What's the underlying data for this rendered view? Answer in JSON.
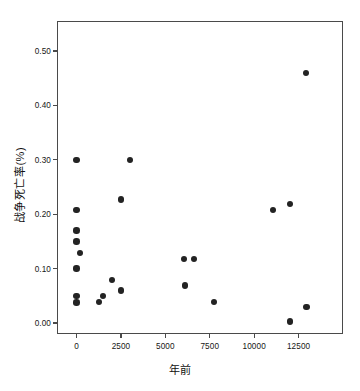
{
  "chart": {
    "title": "",
    "y_axis_label": "战争死亡率(%)",
    "x_axis_label": "年前"
  },
  "chart_data": {
    "type": "scatter",
    "title": "",
    "xlabel": "年前",
    "ylabel": "战争死亡率(%)",
    "xlim": [
      -1100,
      15000
    ],
    "ylim": [
      -0.02,
      0.555
    ],
    "grid": false,
    "legend": null,
    "xticks": [
      0,
      2500,
      5000,
      7500,
      10000,
      12500
    ],
    "xticklabels": [
      "0",
      "2500",
      "5000",
      "7500",
      "10000",
      "12500"
    ],
    "yticks": [
      0.0,
      0.1,
      0.2,
      0.3,
      0.4,
      0.5
    ],
    "yticklabels": [
      "0.00",
      "0.10",
      "0.20",
      "0.30",
      "0.40",
      "0.50"
    ],
    "marker": "circle",
    "marker_color": "#232323",
    "marker_size": 6.4,
    "points": [
      {
        "x": 0,
        "y": 0.3
      },
      {
        "x": 0,
        "y": 0.208
      },
      {
        "x": 0,
        "y": 0.17
      },
      {
        "x": 0,
        "y": 0.15
      },
      {
        "x": 200,
        "y": 0.129
      },
      {
        "x": 0,
        "y": 0.1
      },
      {
        "x": 0,
        "y": 0.05
      },
      {
        "x": 0,
        "y": 0.038
      },
      {
        "x": 1250,
        "y": 0.039
      },
      {
        "x": 1500,
        "y": 0.05
      },
      {
        "x": 2000,
        "y": 0.079
      },
      {
        "x": 2500,
        "y": 0.06
      },
      {
        "x": 2500,
        "y": 0.227
      },
      {
        "x": 3000,
        "y": 0.3
      },
      {
        "x": 6050,
        "y": 0.118
      },
      {
        "x": 6600,
        "y": 0.118
      },
      {
        "x": 6100,
        "y": 0.069
      },
      {
        "x": 7750,
        "y": 0.039
      },
      {
        "x": 11050,
        "y": 0.208
      },
      {
        "x": 12000,
        "y": 0.219
      },
      {
        "x": 12000,
        "y": 0.003
      },
      {
        "x": 12950,
        "y": 0.03
      },
      {
        "x": 12900,
        "y": 0.46
      }
    ]
  },
  "colors": {
    "marker": "#232323",
    "axis": "#4a4a4a",
    "text": "#161616",
    "background": "#ffffff"
  }
}
